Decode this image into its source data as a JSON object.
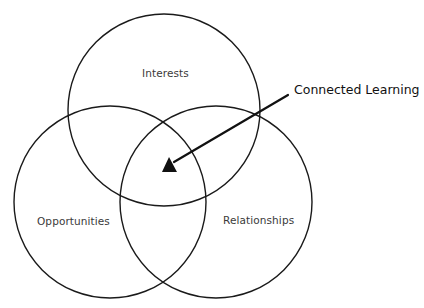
{
  "diagram": {
    "type": "venn",
    "sets": [
      {
        "id": "interests",
        "label": "Interests",
        "cx": 164,
        "cy": 110,
        "r": 96
      },
      {
        "id": "opportunities",
        "label": "Opportunities",
        "cx": 110,
        "cy": 202,
        "r": 96
      },
      {
        "id": "relationships",
        "label": "Relationships",
        "cx": 216,
        "cy": 202,
        "r": 96
      }
    ],
    "callout": {
      "label": "Connected Learning",
      "points_to": "intersection of Interests, Opportunities, Relationships",
      "arrow_from": [
        288,
        95
      ],
      "arrow_to": [
        174,
        163
      ]
    },
    "colors": {
      "stroke": "#1a1a1a",
      "label_text": "#3a3a3a",
      "callout_text": "#111111",
      "background": "#ffffff"
    }
  }
}
